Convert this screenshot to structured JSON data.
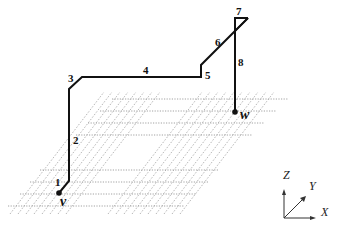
{
  "diagram": {
    "segments": [
      {
        "id": "1",
        "label": "1"
      },
      {
        "id": "2",
        "label": "2"
      },
      {
        "id": "3",
        "label": "3"
      },
      {
        "id": "4",
        "label": "4"
      },
      {
        "id": "5",
        "label": "5"
      },
      {
        "id": "6",
        "label": "6"
      },
      {
        "id": "7",
        "label": "7"
      },
      {
        "id": "8",
        "label": "8"
      }
    ],
    "endpoints": {
      "start": "v",
      "end": "w"
    },
    "axes": {
      "x": "X",
      "y": "Y",
      "z": "Z"
    },
    "colors": {
      "wire": "#111111",
      "grid": "#8a8a8a",
      "background": "#ffffff"
    }
  }
}
